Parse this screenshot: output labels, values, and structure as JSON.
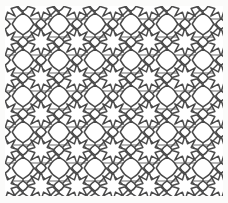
{
  "image": {
    "title": "Islamic geometric star-and-cross tessellation",
    "alt_text": "Repeating interlaced geometric lattice of eight-pointed stars, crosses and lozenges drawn in dark gray line work on a white ground",
    "width": 228,
    "height": 203,
    "style": "line drawing",
    "subject": "geometric tiling pattern"
  },
  "canvas": {
    "background_color": "#ffffff",
    "paper_color": "#fbfbfa",
    "margin_color": "#ffffff",
    "margin_left": 5,
    "margin_top": 6,
    "margin_right": 5,
    "margin_bottom": 7
  },
  "pattern": {
    "name": "star-and-cross-lattice",
    "motif": "eight-pointed star",
    "line_color": "#4a4a4a",
    "line_color_light": "#8a8a8a",
    "line_color_dark": "#3a3a3a",
    "fill_color": "#ffffff",
    "stroke_width_main": 1.5,
    "stroke_width_thin": 1.1,
    "cell_size": 36,
    "columns": 7,
    "rows": 6,
    "origin_x": 5,
    "origin_y": 6,
    "tile_width": 218,
    "tile_height": 190,
    "diagonal_angle_deg": 45,
    "has_vertical_rails": true,
    "has_horizontal_rails": true,
    "rail_spacing": 36,
    "interlace": "overlapping straight and curved strapwork"
  },
  "legend": {
    "visible": false,
    "entries": []
  },
  "labels": {
    "visible": false,
    "items": []
  }
}
